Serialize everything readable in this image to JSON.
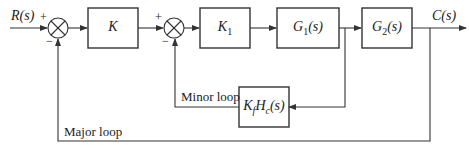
{
  "diagram": {
    "type": "block-diagram",
    "input": {
      "label": "R(s)"
    },
    "output": {
      "label": "C(s)"
    },
    "summing_junctions": [
      {
        "id": "sum1",
        "plus": "+",
        "minus": "−"
      },
      {
        "id": "sum2",
        "plus": "+",
        "minus": "−"
      }
    ],
    "blocks": [
      {
        "id": "K",
        "label": "K"
      },
      {
        "id": "K1",
        "label": "K",
        "sub": "1"
      },
      {
        "id": "G1",
        "label": "G",
        "sub": "1",
        "suffix": "(s)"
      },
      {
        "id": "G2",
        "label": "G",
        "sub": "2",
        "suffix": "(s)"
      },
      {
        "id": "KfHc",
        "label1": "K",
        "sub1": "f",
        "label2": "H",
        "sub2": "c",
        "suffix": "(s)"
      }
    ],
    "loops": {
      "minor": "Minor loop",
      "major": "Major loop"
    },
    "colors": {
      "line": "#333333",
      "background": "#ffffff"
    }
  }
}
